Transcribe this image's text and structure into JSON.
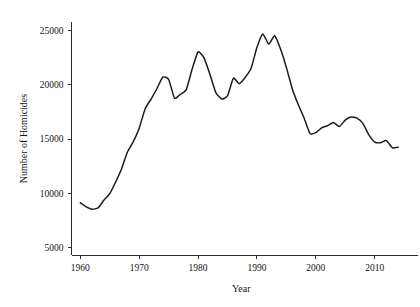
{
  "chart_data": {
    "type": "line",
    "title": "",
    "xlabel": "Year",
    "ylabel": "Number of Homicides",
    "xlim": [
      1958.5,
      2015.5
    ],
    "ylim": [
      4300,
      25800
    ],
    "grid": false,
    "legend": "none",
    "xticks": [
      1960,
      1970,
      1980,
      1990,
      2000,
      2010
    ],
    "xtick_labels": [
      "1960",
      "1970",
      "1980",
      "1990",
      "2000",
      "2010"
    ],
    "yticks": [
      5000,
      10000,
      15000,
      20000,
      25000
    ],
    "ytick_labels": [
      "5000",
      "10000",
      "15000",
      "20000",
      "25000"
    ],
    "series": [
      {
        "name": "Number of Homicides",
        "color": "#1b1b1b",
        "x": [
          1960,
          1961,
          1962,
          1963,
          1964,
          1965,
          1966,
          1967,
          1968,
          1969,
          1970,
          1971,
          1972,
          1973,
          1974,
          1975,
          1976,
          1977,
          1978,
          1979,
          1980,
          1981,
          1982,
          1983,
          1984,
          1985,
          1986,
          1987,
          1988,
          1989,
          1990,
          1991,
          1992,
          1993,
          1994,
          1995,
          1996,
          1997,
          1998,
          1999,
          2000,
          2001,
          2002,
          2003,
          2004,
          2005,
          2006,
          2007,
          2008,
          2009,
          2010,
          2011,
          2012,
          2013,
          2014
        ],
        "values": [
          9110,
          8740,
          8530,
          8640,
          9360,
          9960,
          11040,
          12240,
          13800,
          14760,
          16000,
          17780,
          18670,
          19640,
          20710,
          20510,
          18780,
          19120,
          19560,
          21460,
          23040,
          22520,
          21010,
          19308,
          18692,
          18976,
          20613,
          20096,
          20675,
          21500,
          23440,
          24700,
          23760,
          24530,
          23330,
          21610,
          19650,
          18210,
          16970,
          15522,
          15586,
          16037,
          16229,
          16528,
          16148,
          16740,
          17030,
          16929,
          16442,
          15399,
          14722,
          14661,
          14856,
          14196,
          14249
        ]
      }
    ]
  },
  "axes": {
    "y_title": "Number of Homicides",
    "x_title": "Year"
  }
}
